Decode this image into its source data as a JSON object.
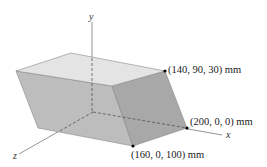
{
  "figure": {
    "axes": {
      "x": "x",
      "y": "y",
      "z": "z"
    },
    "points": [
      {
        "label": "(140, 90, 30) mm"
      },
      {
        "label": "(200, 0, 0) mm"
      },
      {
        "label": "(160, 0, 100) mm"
      }
    ],
    "colors": {
      "top_face": "#e3e3e3",
      "front_face": "#bdbdbd",
      "right_face": "#a9a9a9",
      "edge": "#7a7a7a",
      "axis": "#555555"
    }
  }
}
